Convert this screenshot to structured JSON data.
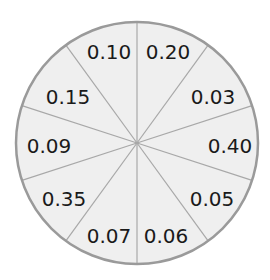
{
  "wheel": {
    "center": [
      137,
      143
    ],
    "radius": 121,
    "fill_color": "#efefef",
    "stroke_color": "#9a9a9a",
    "divider_color": "#a8a8a8",
    "sector_count": 10,
    "sectors": [
      {
        "label": "0.20",
        "start_deg": 0,
        "end_deg": 36,
        "label_pos": [
          168,
          52
        ]
      },
      {
        "label": "0.03",
        "start_deg": 36,
        "end_deg": 72,
        "label_pos": [
          213,
          97
        ]
      },
      {
        "label": "0.40",
        "start_deg": 72,
        "end_deg": 108,
        "label_pos": [
          230,
          146
        ]
      },
      {
        "label": "0.05",
        "start_deg": 108,
        "end_deg": 144,
        "label_pos": [
          212,
          199
        ]
      },
      {
        "label": "0.06",
        "start_deg": 144,
        "end_deg": 180,
        "label_pos": [
          166,
          236
        ]
      },
      {
        "label": "0.07",
        "start_deg": 180,
        "end_deg": 216,
        "label_pos": [
          109,
          236
        ]
      },
      {
        "label": "0.35",
        "start_deg": 216,
        "end_deg": 252,
        "label_pos": [
          64,
          199
        ]
      },
      {
        "label": "0.09",
        "start_deg": 252,
        "end_deg": 288,
        "label_pos": [
          49,
          146
        ]
      },
      {
        "label": "0.15",
        "start_deg": 288,
        "end_deg": 324,
        "label_pos": [
          68,
          97
        ]
      },
      {
        "label": "0.10",
        "start_deg": 324,
        "end_deg": 360,
        "label_pos": [
          109,
          52
        ]
      }
    ]
  }
}
